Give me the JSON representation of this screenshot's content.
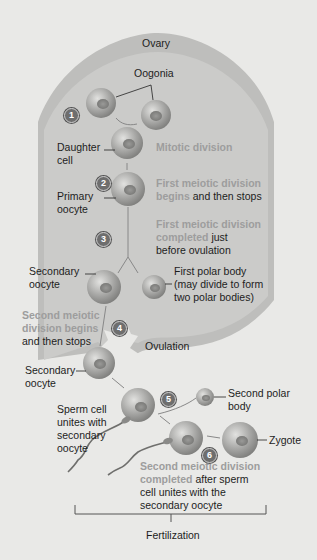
{
  "colors": {
    "background": "#e9e9e7",
    "ovary_outer": "#bdbdbb",
    "ovary_inner": "#cacac8",
    "cell_light": "#d6d6d4",
    "cell_dark": "#8a8a88",
    "emphasis_text": "#9d9d9d",
    "body_text": "#1d1d1d",
    "step_badge": "#6e6e6e"
  },
  "labels": {
    "ovary": "Ovary",
    "oogonia": "Oogonia",
    "daughter_cell_1": "Daughter",
    "daughter_cell_2": "cell",
    "mitotic_division": "Mitotic division",
    "primary_oocyte_1": "Primary",
    "primary_oocyte_2": "oocyte",
    "first_meiotic_begins_1": "First meiotic division",
    "first_meiotic_begins_2a": "begins",
    "first_meiotic_begins_2b": " and then stops",
    "first_meiotic_completed_1": "First meiotic division",
    "first_meiotic_completed_2a": "completed",
    "first_meiotic_completed_2b": " just",
    "first_meiotic_completed_3": "before ovulation",
    "secondary_oocyte_a_1": "Secondary",
    "secondary_oocyte_a_2": "oocyte",
    "first_polar_body_1": "First polar body",
    "first_polar_body_2": "(may divide to form",
    "first_polar_body_3": "two polar bodies)",
    "second_meiotic_begins_1": "Second meiotic",
    "second_meiotic_begins_2": "division begins",
    "second_meiotic_begins_3": "and then stops",
    "ovulation": "Ovulation",
    "secondary_oocyte_b_1": "Secondary",
    "secondary_oocyte_b_2": "oocyte",
    "sperm_unites_1": "Sperm cell",
    "sperm_unites_2": "unites with",
    "sperm_unites_3": "secondary",
    "sperm_unites_4": "oocyte",
    "second_polar_body_1": "Second polar",
    "second_polar_body_2": "body",
    "zygote": "Zygote",
    "second_meiotic_completed_1": "Second meiotic division",
    "second_meiotic_completed_2a": "completed",
    "second_meiotic_completed_2b": " after sperm",
    "second_meiotic_completed_3": "cell unites with the",
    "second_meiotic_completed_4": "secondary oocyte",
    "fertilization": "Fertilization"
  },
  "steps": [
    "1",
    "2",
    "3",
    "4",
    "5",
    "6"
  ]
}
